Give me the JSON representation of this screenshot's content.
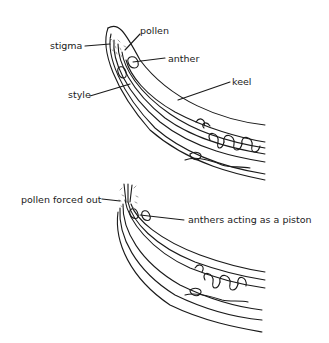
{
  "diagram": {
    "top_panel": {
      "labels": {
        "stigma": "stigma",
        "pollen": "pollen",
        "anther": "anther",
        "style": "style",
        "keel": "keel"
      }
    },
    "bottom_panel": {
      "labels": {
        "pollen_forced_out": "pollen forced out",
        "anthers_piston": "anthers acting as a piston"
      }
    },
    "colors": {
      "line": "#1a1a1a",
      "background": "#ffffff",
      "pollen_stipple": "#888888"
    }
  }
}
